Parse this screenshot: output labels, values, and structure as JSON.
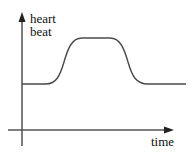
{
  "diagram": {
    "y_axis_label_line1": "heart",
    "y_axis_label_line2": "beat",
    "x_axis_label": "time",
    "line_color": "#4a4a4a",
    "axis_color": "#555555"
  }
}
